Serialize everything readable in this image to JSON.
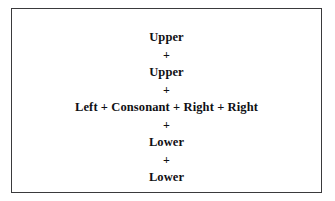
{
  "figure": {
    "border_color": "#3a3a3c",
    "background_color": "#ffffff",
    "text_color": "#101014",
    "lines": [
      {
        "text": "Upper",
        "role": "term"
      },
      {
        "text": "+",
        "role": "operator"
      },
      {
        "text": "Upper",
        "role": "term"
      },
      {
        "text": "+",
        "role": "operator"
      },
      {
        "text": "Left + Consonant + Right + Right",
        "role": "expanded"
      },
      {
        "text": "+",
        "role": "operator"
      },
      {
        "text": "Lower",
        "role": "term"
      },
      {
        "text": "+",
        "role": "operator"
      },
      {
        "text": "Lower",
        "role": "term"
      }
    ]
  }
}
